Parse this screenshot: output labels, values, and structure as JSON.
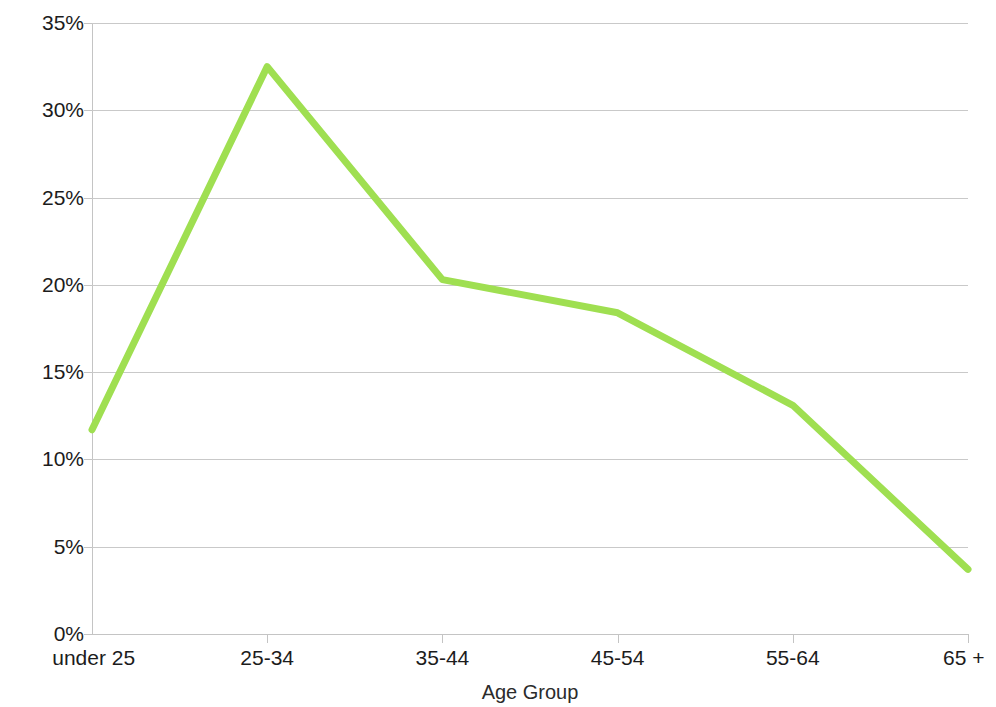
{
  "chart_data": {
    "type": "line",
    "title": "",
    "xlabel": "Age Group",
    "ylabel": "Percent of Workforce",
    "categories": [
      "under 25",
      "25-34",
      "35-44",
      "45-54",
      "55-64",
      "65 +"
    ],
    "values": [
      11.7,
      32.5,
      20.3,
      18.4,
      13.1,
      3.7
    ],
    "series": [
      {
        "name": "Percent of Workforce",
        "values": [
          11.7,
          32.5,
          20.3,
          18.4,
          13.1,
          3.7
        ]
      }
    ],
    "ylim": [
      0,
      35
    ],
    "ytick_labels": [
      "0%",
      "5%",
      "10%",
      "15%",
      "20%",
      "25%",
      "30%",
      "35%"
    ],
    "ytick_values": [
      0,
      5,
      10,
      15,
      20,
      25,
      30,
      35
    ],
    "ytick_step": 5,
    "grid": true,
    "grid_axis": "y",
    "legend": "none",
    "line_color": "#9FDF51",
    "line_width": 7,
    "markers": false,
    "background_color": "#FFFFFF",
    "gridline_color": "#C9C9C9",
    "axis_color": "#C4C4C4",
    "text_color": "#1C1C1C"
  }
}
